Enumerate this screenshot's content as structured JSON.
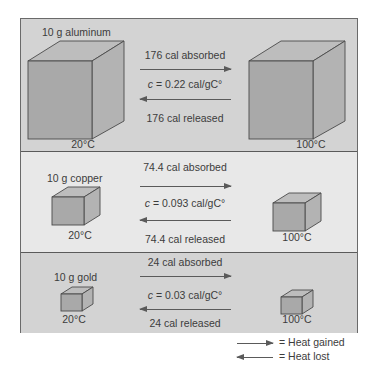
{
  "figure": {
    "type": "specific-heat-comparison",
    "rows": [
      {
        "metal_label": "10 g aluminum",
        "start_temp": "20°C",
        "end_temp": "100°C",
        "absorbed_label": "176 cal absorbed",
        "specific_heat_var": "c",
        "specific_heat_value": " = 0.22 cal/gC°",
        "released_label": "176 cal released"
      },
      {
        "metal_label": "10 g copper",
        "start_temp": "20°C",
        "end_temp": "100°C",
        "absorbed_label": "74.4 cal absorbed",
        "specific_heat_var": "c",
        "specific_heat_value": " = 0.093 cal/gC°",
        "released_label": "74.4 cal released"
      },
      {
        "metal_label": "10 g gold",
        "start_temp": "20°C",
        "end_temp": "100°C",
        "absorbed_label": "24 cal absorbed",
        "specific_heat_var": "c",
        "specific_heat_value": " = 0.03 cal/gC°",
        "released_label": "24 cal released"
      }
    ],
    "legend": {
      "gained_label": "= Heat gained",
      "lost_label": "= Heat lost"
    },
    "colors": {
      "panel_dark": "#d3d3d3",
      "panel_light": "#e8e8e8",
      "cube_front": "#a9a9a9",
      "cube_top": "#bdbdbd",
      "cube_side": "#b3b3b3",
      "line": "#5a5a5a"
    }
  }
}
